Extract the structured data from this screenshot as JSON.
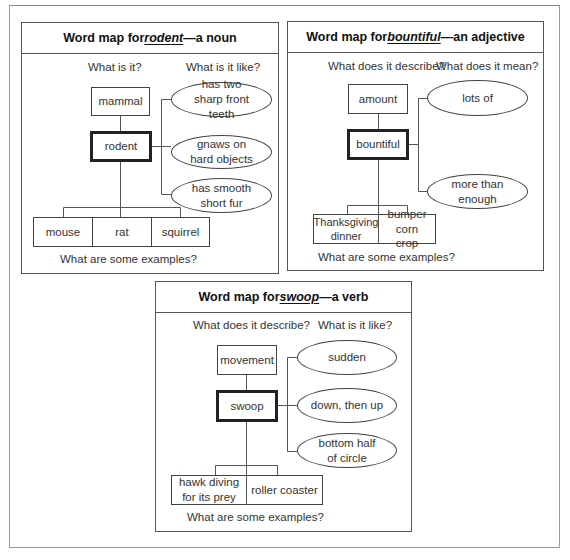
{
  "maps": [
    {
      "title_prefix": "Word map for ",
      "keyword": "rodent",
      "title_suffix": "—a noun",
      "left_question": "What is it?",
      "right_question": "What is it like?",
      "category": "mammal",
      "word": "rodent",
      "qualities": [
        "has two sharp front teeth",
        "gnaws on hard objects",
        "has smooth short fur"
      ],
      "examples": [
        "mouse",
        "rat",
        "squirrel"
      ],
      "bottom_question": "What are some examples?"
    },
    {
      "title_prefix": "Word map for ",
      "keyword": "bountiful",
      "title_suffix": "—an adjective",
      "left_question": "What does it describe?",
      "right_question": "What does it mean?",
      "category": "amount",
      "word": "bountiful",
      "qualities": [
        "lots of",
        "more than enough"
      ],
      "examples": [
        "Thanksgiving dinner",
        "bumper corn crop"
      ],
      "bottom_question": "What are some examples?"
    },
    {
      "title_prefix": "Word map for ",
      "keyword": "swoop",
      "title_suffix": "—a verb",
      "left_question": "What does it describe?",
      "right_question": "What is it like?",
      "category": "movement",
      "word": "swoop",
      "qualities": [
        "sudden",
        "down, then up",
        "bottom half of circle"
      ],
      "examples": [
        "hawk diving for its prey",
        "roller coaster"
      ],
      "bottom_question": "What are some examples?"
    }
  ]
}
